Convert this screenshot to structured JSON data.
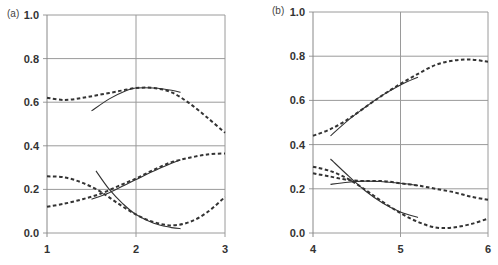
{
  "chart_data": [
    {
      "type": "line",
      "panel_label": "(a)",
      "title": "",
      "xlabel": "",
      "ylabel": "",
      "xlim": [
        1,
        3
      ],
      "ylim": [
        0,
        1.0
      ],
      "xticks": [
        "1",
        "2",
        "3"
      ],
      "yticks": [
        "0.0",
        "0.2",
        "0.4",
        "0.6",
        "0.8",
        "1.0"
      ],
      "grid": true,
      "legend": null,
      "series": [
        {
          "name": "dashed-upper",
          "style": "dashed",
          "x": [
            1.0,
            1.2,
            1.4,
            1.6,
            1.8,
            2.0,
            2.2,
            2.4,
            2.6,
            2.8,
            3.0
          ],
          "y": [
            0.62,
            0.61,
            0.62,
            0.635,
            0.65,
            0.665,
            0.665,
            0.645,
            0.595,
            0.53,
            0.46
          ]
        },
        {
          "name": "solid-upper",
          "style": "solid",
          "x": [
            1.5,
            1.7,
            1.9,
            2.0,
            2.2,
            2.4,
            2.5
          ],
          "y": [
            0.56,
            0.615,
            0.655,
            0.665,
            0.665,
            0.655,
            0.645
          ]
        },
        {
          "name": "dashed-rising",
          "style": "dashed",
          "x": [
            1.0,
            1.2,
            1.4,
            1.6,
            1.8,
            2.0,
            2.2,
            2.4,
            2.6,
            2.8,
            3.0
          ],
          "y": [
            0.12,
            0.135,
            0.155,
            0.18,
            0.215,
            0.25,
            0.29,
            0.325,
            0.345,
            0.36,
            0.365
          ]
        },
        {
          "name": "solid-rising",
          "style": "solid",
          "x": [
            1.5,
            1.7,
            1.9,
            2.0,
            2.2,
            2.4,
            2.5
          ],
          "y": [
            0.155,
            0.185,
            0.225,
            0.245,
            0.285,
            0.32,
            0.335
          ]
        },
        {
          "name": "dashed-falling",
          "style": "dashed",
          "x": [
            1.0,
            1.2,
            1.4,
            1.6,
            1.8,
            2.0,
            2.2,
            2.4,
            2.6,
            2.8,
            3.0
          ],
          "y": [
            0.26,
            0.255,
            0.23,
            0.19,
            0.135,
            0.085,
            0.05,
            0.035,
            0.05,
            0.095,
            0.165
          ]
        },
        {
          "name": "solid-falling",
          "style": "solid",
          "x": [
            1.55,
            1.7,
            1.85,
            2.0,
            2.2,
            2.4,
            2.5
          ],
          "y": [
            0.285,
            0.2,
            0.135,
            0.085,
            0.045,
            0.025,
            0.02
          ]
        }
      ]
    },
    {
      "type": "line",
      "panel_label": "(b)",
      "title": "",
      "xlabel": "",
      "ylabel": "",
      "xlim": [
        4,
        6
      ],
      "ylim": [
        0,
        1.0
      ],
      "xticks": [
        "4",
        "5",
        "6"
      ],
      "yticks": [
        "0.0",
        "0.2",
        "0.4",
        "0.6",
        "0.8",
        "1.0"
      ],
      "grid": true,
      "legend": null,
      "series": [
        {
          "name": "dashed-upper",
          "style": "dashed",
          "x": [
            4.0,
            4.2,
            4.4,
            4.6,
            4.8,
            5.0,
            5.2,
            5.4,
            5.6,
            5.8,
            6.0
          ],
          "y": [
            0.44,
            0.47,
            0.515,
            0.57,
            0.625,
            0.675,
            0.72,
            0.76,
            0.78,
            0.785,
            0.775
          ]
        },
        {
          "name": "solid-upper",
          "style": "solid",
          "x": [
            4.2,
            4.4,
            4.6,
            4.8,
            5.0,
            5.2
          ],
          "y": [
            0.44,
            0.51,
            0.57,
            0.625,
            0.67,
            0.705
          ]
        },
        {
          "name": "dashed-flat",
          "style": "dashed",
          "x": [
            4.0,
            4.2,
            4.4,
            4.6,
            4.8,
            5.0,
            5.2,
            5.4,
            5.6,
            5.8,
            6.0
          ],
          "y": [
            0.27,
            0.255,
            0.24,
            0.235,
            0.235,
            0.225,
            0.215,
            0.2,
            0.185,
            0.165,
            0.15
          ]
        },
        {
          "name": "solid-flat",
          "style": "solid",
          "x": [
            4.2,
            4.4,
            4.6,
            4.8,
            5.0,
            5.2
          ],
          "y": [
            0.22,
            0.23,
            0.235,
            0.232,
            0.225,
            0.215
          ]
        },
        {
          "name": "dashed-falling",
          "style": "dashed",
          "x": [
            4.0,
            4.2,
            4.4,
            4.6,
            4.8,
            5.0,
            5.2,
            5.4,
            5.6,
            5.8,
            6.0
          ],
          "y": [
            0.3,
            0.28,
            0.245,
            0.195,
            0.14,
            0.09,
            0.05,
            0.025,
            0.025,
            0.04,
            0.065
          ]
        },
        {
          "name": "solid-falling",
          "style": "solid",
          "x": [
            4.2,
            4.4,
            4.6,
            4.8,
            5.0,
            5.2
          ],
          "y": [
            0.335,
            0.26,
            0.19,
            0.135,
            0.095,
            0.07
          ]
        }
      ]
    }
  ],
  "layout": {
    "panels": [
      {
        "left": 47,
        "right": 225,
        "top": 15,
        "bottom": 233,
        "label_x": 7,
        "label_y": 17
      },
      {
        "left": 313,
        "right": 488,
        "top": 12,
        "bottom": 233,
        "label_x": 272,
        "label_y": 14
      }
    ]
  }
}
